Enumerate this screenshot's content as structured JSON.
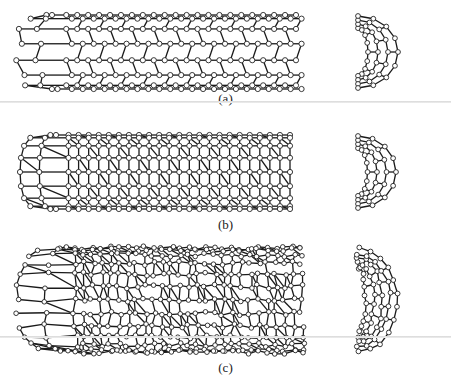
{
  "figure": {
    "panels": [
      {
        "id": "a",
        "label": "(a)",
        "structure": "hexagonal-armchair-nanotube",
        "tube": {
          "x": 14,
          "y": 12,
          "w": 286,
          "h": 80,
          "rows": 3,
          "cols": 11
        },
        "cap": {
          "x": 352,
          "y": 12,
          "w": 52,
          "h": 80
        },
        "label_y": 92,
        "rule_y": 101
      },
      {
        "id": "b",
        "label": "(b)",
        "structure": "haeckelite-pentagon-heptagon-nanotube",
        "tube": {
          "x": 18,
          "y": 132,
          "w": 276,
          "h": 80,
          "rows": 4,
          "cols": 12
        },
        "cap": {
          "x": 352,
          "y": 132,
          "w": 50,
          "h": 80
        },
        "label_y": 218
      },
      {
        "id": "c",
        "label": "(c)",
        "structure": "disordered-haeckelite-nanotube",
        "tube": {
          "x": 16,
          "y": 245,
          "w": 290,
          "h": 110,
          "rows": 6,
          "cols": 14
        },
        "cap": {
          "x": 352,
          "y": 245,
          "w": 52,
          "h": 110
        },
        "label_y": 361,
        "rule_y": 336
      }
    ],
    "colors": {
      "bond": "#1a1a1a",
      "atom_fill": "#ffffff",
      "atom_stroke": "#222222",
      "label": "#222222"
    }
  }
}
